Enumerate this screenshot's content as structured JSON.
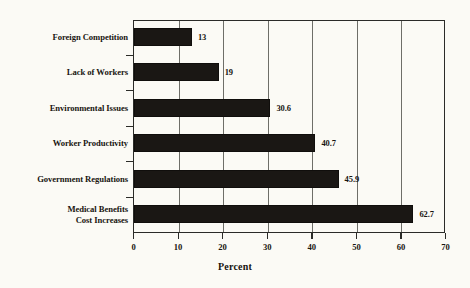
{
  "chart_data": {
    "type": "bar",
    "orientation": "horizontal",
    "title": "",
    "xlabel": "Percent",
    "ylabel": "",
    "categories": [
      "Foreign Competition",
      "Lack of Workers",
      "Environmental Issues",
      "Worker Productivity",
      "Government Regulations",
      "Medical Benefits\nCost Increases"
    ],
    "values": [
      13,
      19,
      30.6,
      40.7,
      45.9,
      62.7
    ],
    "data_labels": [
      "13",
      "19",
      "30.6",
      "40.7",
      "45.9",
      "62.7"
    ],
    "xlim": [
      0,
      70
    ],
    "xticks": [
      0,
      10,
      20,
      30,
      40,
      50,
      60,
      70
    ],
    "xticklabels": [
      "0",
      "10",
      "20",
      "30",
      "40",
      "50",
      "60",
      "70"
    ],
    "grid": true,
    "grid_axis": "x",
    "legend": false,
    "bar_color": "#1a1714",
    "background_color": "#fbfaf5",
    "axis_color": "#2b2b28",
    "gridline_color": "#6e6e68",
    "text_color": "#181510"
  }
}
